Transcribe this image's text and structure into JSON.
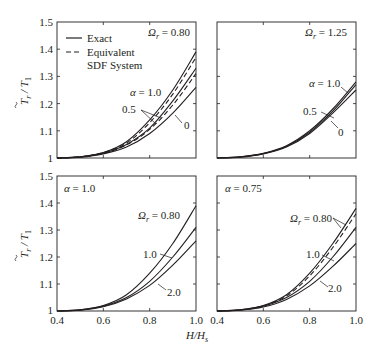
{
  "figure": {
    "ylabel": "T̃r / T1",
    "xlabel": "H/Hs",
    "legend": {
      "solid": "Exact",
      "dashed_line1": "Equivalent",
      "dashed_line2": "SDF System"
    }
  },
  "chart_data": [
    {
      "type": "line",
      "panel": "top-left",
      "annotation": "Ωr = 0.80",
      "xlim": [
        0.4,
        1.0
      ],
      "ylim": [
        1.0,
        1.5
      ],
      "xticks": [
        "0.4",
        "0.6",
        "0.8",
        "1.0"
      ],
      "yticks": [
        "1",
        "1.1",
        "1.2",
        "1.3",
        "1.4",
        "1.5"
      ],
      "xlabel": "H/Hs",
      "ylabel": "T̃r/T1",
      "legend": [
        "Exact",
        "Equivalent SDF System"
      ],
      "x": [
        0.4,
        0.5,
        0.6,
        0.7,
        0.8,
        0.9,
        1.0
      ],
      "series": [
        {
          "name": "α = 1.0 (Exact)",
          "style": "solid",
          "values": [
            1.0,
            1.004,
            1.02,
            1.06,
            1.14,
            1.25,
            1.39
          ]
        },
        {
          "name": "α = 1.0 (SDF)",
          "style": "dashed",
          "values": [
            1.0,
            1.004,
            1.02,
            1.055,
            1.13,
            1.235,
            1.37
          ]
        },
        {
          "name": "α = 0.5 (Exact)",
          "style": "solid",
          "values": [
            1.0,
            1.004,
            1.018,
            1.05,
            1.11,
            1.21,
            1.33
          ]
        },
        {
          "name": "α = 0.5 (SDF)",
          "style": "dashed",
          "values": [
            1.0,
            1.004,
            1.017,
            1.048,
            1.105,
            1.195,
            1.31
          ]
        },
        {
          "name": "α = 0 (Exact)",
          "style": "solid",
          "values": [
            1.0,
            1.003,
            1.015,
            1.04,
            1.09,
            1.165,
            1.26
          ]
        }
      ],
      "labels": [
        "α = 1.0",
        "0.5",
        "0"
      ]
    },
    {
      "type": "line",
      "panel": "top-right",
      "annotation": "Ωr = 1.25",
      "xlim": [
        0.4,
        1.0
      ],
      "ylim": [
        1.0,
        1.5
      ],
      "x": [
        0.4,
        0.5,
        0.6,
        0.7,
        0.8,
        0.9,
        1.0
      ],
      "series": [
        {
          "name": "α = 1.0",
          "style": "solid",
          "values": [
            1.0,
            1.004,
            1.017,
            1.045,
            1.1,
            1.18,
            1.28
          ]
        },
        {
          "name": "α = 0.5",
          "style": "solid",
          "values": [
            1.0,
            1.004,
            1.016,
            1.043,
            1.095,
            1.172,
            1.27
          ]
        },
        {
          "name": "α = 0",
          "style": "solid",
          "values": [
            1.0,
            1.003,
            1.015,
            1.04,
            1.09,
            1.165,
            1.25
          ]
        }
      ],
      "labels": [
        "α = 1.0",
        "0.5",
        "0"
      ]
    },
    {
      "type": "line",
      "panel": "bottom-left",
      "annotation": "α = 1.0",
      "xlim": [
        0.4,
        1.0
      ],
      "ylim": [
        1.0,
        1.5
      ],
      "xticks": [
        "0.4",
        "0.6",
        "0.8",
        "1.0"
      ],
      "yticks": [
        "1",
        "1.1",
        "1.2",
        "1.3",
        "1.4",
        "1.5"
      ],
      "x": [
        0.4,
        0.5,
        0.6,
        0.7,
        0.8,
        0.9,
        1.0
      ],
      "series": [
        {
          "name": "Ωr = 0.80",
          "style": "solid",
          "values": [
            1.0,
            1.004,
            1.02,
            1.06,
            1.14,
            1.25,
            1.39
          ]
        },
        {
          "name": "Ωr = 1.0",
          "style": "solid",
          "values": [
            1.0,
            1.004,
            1.018,
            1.05,
            1.11,
            1.2,
            1.31
          ]
        },
        {
          "name": "Ωr = 2.0",
          "style": "solid",
          "values": [
            1.0,
            1.003,
            1.016,
            1.045,
            1.095,
            1.17,
            1.26
          ]
        }
      ],
      "labels": [
        "Ωr = 0.80",
        "1.0",
        "2.0"
      ]
    },
    {
      "type": "line",
      "panel": "bottom-right",
      "annotation": "α = 0.75",
      "xlim": [
        0.4,
        1.0
      ],
      "ylim": [
        1.0,
        1.5
      ],
      "xticks": [
        "0.4",
        "0.6",
        "0.8",
        "1.0"
      ],
      "x": [
        0.4,
        0.5,
        0.6,
        0.7,
        0.8,
        0.9,
        1.0
      ],
      "series": [
        {
          "name": "Ωr = 0.80 (Exact)",
          "style": "solid",
          "values": [
            1.0,
            1.004,
            1.02,
            1.06,
            1.14,
            1.25,
            1.38
          ]
        },
        {
          "name": "Ωr = 0.80 (SDF)",
          "style": "dashed",
          "values": [
            1.0,
            1.004,
            1.019,
            1.056,
            1.13,
            1.235,
            1.36
          ]
        },
        {
          "name": "Ωr = 1.0",
          "style": "solid",
          "values": [
            1.0,
            1.004,
            1.018,
            1.05,
            1.11,
            1.2,
            1.31
          ]
        },
        {
          "name": "Ωr = 2.0",
          "style": "solid",
          "values": [
            1.0,
            1.003,
            1.015,
            1.043,
            1.093,
            1.165,
            1.25
          ]
        }
      ],
      "labels": [
        "Ωr = 0.80",
        "1.0",
        "2.0"
      ]
    }
  ],
  "text": {
    "yticks": [
      "1",
      "1.1",
      "1.2",
      "1.3",
      "1.4",
      "1.5"
    ],
    "xticks": [
      "0.4",
      "0.6",
      "0.8",
      "1.0"
    ],
    "xlabel": "H/H",
    "xlabel_sub": "s",
    "ylabel_main": "T",
    "ylabel_sub_r": "r",
    "ylabel_T1": "T",
    "ylabel_sub1": "1",
    "legend_exact": "Exact",
    "legend_equiv": "Equivalent",
    "legend_sdf": "SDF System",
    "tl_annot_sym": "Ω",
    "tl_annot_sub": "r",
    "tl_annot_val": " = 0.80",
    "tl_alpha": "α",
    "tl_alpha_val": " = 1.0",
    "tl_05": "0.5",
    "tl_0": "0",
    "tr_annot_val": " = 1.25",
    "tr_alpha_val": " = 1.0",
    "tr_05": "0.5",
    "tr_0": "0",
    "bl_annot_val": " = 1.0",
    "bl_omega_val": " = 0.80",
    "bl_10": "1.0",
    "bl_20": "2.0",
    "br_annot_val": " = 0.75",
    "br_omega_val": " = 0.80",
    "br_10": "1.0",
    "br_20": "2.0"
  }
}
